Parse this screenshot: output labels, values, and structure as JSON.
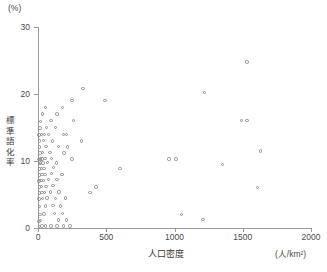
{
  "chart_data": {
    "type": "scatter",
    "title": "",
    "xlabel": "人口密度",
    "ylabel": "標準語化率",
    "x_unit": "(人/km²)",
    "y_unit": "(%)",
    "xlim": [
      0,
      2000
    ],
    "ylim": [
      0,
      30
    ],
    "xticks": [
      0,
      500,
      1000,
      1500,
      2000
    ],
    "yticks": [
      0,
      10,
      20,
      30
    ],
    "xtick_labels": [
      "0",
      "500",
      "1000",
      "1500",
      "2000"
    ],
    "ytick_labels": [
      "0",
      "10",
      "20",
      "30"
    ],
    "grid": false,
    "legend": false,
    "marker": "open-circle",
    "marker_color": "#8d8d8d",
    "points": [
      [
        10,
        0.2
      ],
      [
        30,
        0.3
      ],
      [
        55,
        0.3
      ],
      [
        95,
        0.3
      ],
      [
        140,
        0.3
      ],
      [
        185,
        0.3
      ],
      [
        235,
        0.3
      ],
      [
        8,
        1.0
      ],
      [
        20,
        1.1
      ],
      [
        150,
        1.2
      ],
      [
        210,
        1.2
      ],
      [
        1210,
        1.3
      ],
      [
        15,
        2.0
      ],
      [
        45,
        2.1
      ],
      [
        120,
        2.2
      ],
      [
        180,
        2.2
      ],
      [
        1050,
        2.0
      ],
      [
        10,
        3.2
      ],
      [
        55,
        3.3
      ],
      [
        110,
        3.4
      ],
      [
        165,
        3.3
      ],
      [
        8,
        4.3
      ],
      [
        35,
        4.4
      ],
      [
        65,
        4.5
      ],
      [
        130,
        4.4
      ],
      [
        200,
        4.5
      ],
      [
        12,
        5.2
      ],
      [
        28,
        5.3
      ],
      [
        48,
        5.3
      ],
      [
        90,
        5.4
      ],
      [
        155,
        5.4
      ],
      [
        380,
        5.3
      ],
      [
        10,
        6.1
      ],
      [
        25,
        6.2
      ],
      [
        60,
        6.2
      ],
      [
        110,
        6.3
      ],
      [
        425,
        6.1
      ],
      [
        1610,
        6.0
      ],
      [
        8,
        7.0
      ],
      [
        22,
        7.1
      ],
      [
        40,
        7.1
      ],
      [
        75,
        7.2
      ],
      [
        140,
        7.2
      ],
      [
        12,
        7.9
      ],
      [
        30,
        8.0
      ],
      [
        52,
        8.0
      ],
      [
        98,
        8.1
      ],
      [
        175,
        8.0
      ],
      [
        10,
        8.8
      ],
      [
        26,
        8.9
      ],
      [
        44,
        8.9
      ],
      [
        115,
        9.0
      ],
      [
        600,
        8.9
      ],
      [
        9,
        9.6
      ],
      [
        20,
        9.7
      ],
      [
        38,
        9.7
      ],
      [
        70,
        9.8
      ],
      [
        135,
        9.7
      ],
      [
        1350,
        9.5
      ],
      [
        8,
        10.2
      ],
      [
        18,
        10.3
      ],
      [
        30,
        10.3
      ],
      [
        50,
        10.4
      ],
      [
        100,
        10.4
      ],
      [
        250,
        10.3
      ],
      [
        960,
        10.3
      ],
      [
        1010,
        10.3
      ],
      [
        14,
        11.2
      ],
      [
        34,
        11.3
      ],
      [
        88,
        11.3
      ],
      [
        190,
        11.2
      ],
      [
        1630,
        11.5
      ],
      [
        10,
        12.1
      ],
      [
        58,
        12.2
      ],
      [
        150,
        12.2
      ],
      [
        215,
        12.1
      ],
      [
        12,
        13.0
      ],
      [
        42,
        13.1
      ],
      [
        105,
        13.0
      ],
      [
        320,
        13.0
      ],
      [
        8,
        13.9
      ],
      [
        24,
        14.0
      ],
      [
        46,
        14.0
      ],
      [
        78,
        14.0
      ],
      [
        185,
        14.0
      ],
      [
        210,
        14.0
      ],
      [
        16,
        14.9
      ],
      [
        62,
        15.0
      ],
      [
        130,
        15.0
      ],
      [
        20,
        15.9
      ],
      [
        95,
        16.0
      ],
      [
        260,
        16.0
      ],
      [
        1490,
        16.0
      ],
      [
        1530,
        16.0
      ],
      [
        35,
        17.0
      ],
      [
        140,
        17.0
      ],
      [
        55,
        18.0
      ],
      [
        180,
        18.0
      ],
      [
        250,
        19.0
      ],
      [
        490,
        19.0
      ],
      [
        330,
        20.8
      ],
      [
        1220,
        20.2
      ],
      [
        1530,
        24.8
      ]
    ],
    "axis_color": "#9a9a9a",
    "background": "#ffffff"
  }
}
